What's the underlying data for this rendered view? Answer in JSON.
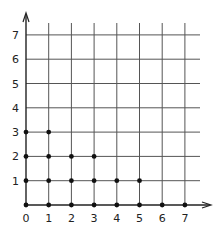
{
  "chart_data": {
    "type": "scatter",
    "title": "",
    "xlabel": "",
    "ylabel": "",
    "xlim": [
      0,
      7
    ],
    "ylim": [
      0,
      7
    ],
    "grid": true,
    "x_ticks": [
      "0",
      "1",
      "2",
      "3",
      "4",
      "5",
      "6",
      "7"
    ],
    "y_ticks": [
      "1",
      "2",
      "3",
      "4",
      "5",
      "6",
      "7"
    ],
    "points": [
      [
        0,
        0
      ],
      [
        1,
        0
      ],
      [
        2,
        0
      ],
      [
        3,
        0
      ],
      [
        4,
        0
      ],
      [
        5,
        0
      ],
      [
        6,
        0
      ],
      [
        7,
        0
      ],
      [
        0,
        1
      ],
      [
        1,
        1
      ],
      [
        2,
        1
      ],
      [
        3,
        1
      ],
      [
        4,
        1
      ],
      [
        5,
        1
      ],
      [
        0,
        2
      ],
      [
        1,
        2
      ],
      [
        2,
        2
      ],
      [
        3,
        2
      ],
      [
        0,
        3
      ],
      [
        1,
        3
      ]
    ],
    "colors": {
      "grid": "#555555",
      "axis": "#222222",
      "point": "#111111"
    }
  }
}
